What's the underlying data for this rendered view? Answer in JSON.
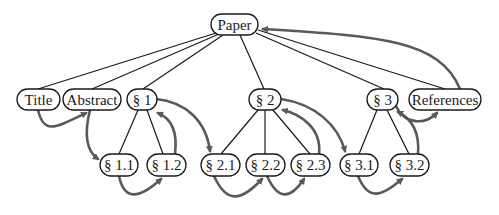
{
  "diagram": {
    "type": "tree-with-reading-order",
    "colors": {
      "tree_edge": "#1a1a1a",
      "flow_arrow": "#5a5a5a",
      "node_border": "#1a1a1a",
      "background": "#ffffff"
    },
    "nodes": {
      "paper": {
        "label": "Paper"
      },
      "title": {
        "label": "Title"
      },
      "abstract": {
        "label": "Abstract"
      },
      "s1": {
        "label": "§ 1"
      },
      "s2": {
        "label": "§ 2"
      },
      "s3": {
        "label": "§ 3"
      },
      "references": {
        "label": "References"
      },
      "s1_1": {
        "label": "§ 1.1"
      },
      "s1_2": {
        "label": "§ 1.2"
      },
      "s2_1": {
        "label": "§ 2.1"
      },
      "s2_2": {
        "label": "§ 2.2"
      },
      "s2_3": {
        "label": "§ 2.3"
      },
      "s3_1": {
        "label": "§ 3.1"
      },
      "s3_2": {
        "label": "§ 3.2"
      }
    },
    "tree_edges": [
      [
        "Paper",
        "Title"
      ],
      [
        "Paper",
        "Abstract"
      ],
      [
        "Paper",
        "§ 1"
      ],
      [
        "Paper",
        "§ 2"
      ],
      [
        "Paper",
        "§ 3"
      ],
      [
        "Paper",
        "References"
      ],
      [
        "§ 1",
        "§ 1.1"
      ],
      [
        "§ 1",
        "§ 1.2"
      ],
      [
        "§ 2",
        "§ 2.1"
      ],
      [
        "§ 2",
        "§ 2.2"
      ],
      [
        "§ 2",
        "§ 2.3"
      ],
      [
        "§ 3",
        "§ 3.1"
      ],
      [
        "§ 3",
        "§ 3.2"
      ]
    ],
    "flow_arrows": [
      [
        "Title",
        "Abstract"
      ],
      [
        "Abstract",
        "§ 1.1"
      ],
      [
        "§ 1.1",
        "§ 1.2"
      ],
      [
        "§ 1.2",
        "§ 1"
      ],
      [
        "§ 1",
        "§ 2.1"
      ],
      [
        "§ 2.1",
        "§ 2.2"
      ],
      [
        "§ 2.2",
        "§ 2.3"
      ],
      [
        "§ 2.3",
        "§ 2"
      ],
      [
        "§ 2",
        "§ 3.1"
      ],
      [
        "§ 3.1",
        "§ 3.2"
      ],
      [
        "§ 3.2",
        "§ 3"
      ],
      [
        "§ 3",
        "References"
      ],
      [
        "References",
        "Paper"
      ]
    ]
  }
}
